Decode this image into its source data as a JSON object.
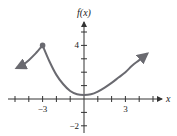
{
  "chart_data": {
    "type": "line",
    "title": "",
    "xlabel": "x",
    "ylabel": "f(x)",
    "xlim": [
      -6,
      5
    ],
    "ylim": [
      -2,
      6
    ],
    "grid": false,
    "legend": null,
    "x_tick_labels": [
      {
        "value": -3,
        "label": "-3"
      },
      {
        "value": 3,
        "label": "3"
      }
    ],
    "y_tick_labels": [
      {
        "value": 4,
        "label": "4"
      },
      {
        "value": -2,
        "label": "-2"
      }
    ],
    "x_ticks": [
      -5,
      -4,
      -3,
      -2,
      -1,
      1,
      2,
      3,
      4,
      5
    ],
    "y_ticks": [
      -2,
      -1,
      1,
      2,
      3,
      4,
      5
    ],
    "series": [
      {
        "name": "left branch",
        "points": [
          [
            -3,
            4
          ],
          [
            -3.5,
            3.4
          ],
          [
            -4,
            2.9
          ],
          [
            -4.5,
            2.5
          ],
          [
            -4.9,
            2.3
          ]
        ],
        "end_arrow": "left"
      },
      {
        "name": "right branch",
        "points": [
          [
            -3,
            4
          ],
          [
            -2.5,
            2.8
          ],
          [
            -2,
            1.8
          ],
          [
            -1.5,
            1.1
          ],
          [
            -1,
            0.6
          ],
          [
            -0.5,
            0.35
          ],
          [
            0,
            0.3
          ],
          [
            0.5,
            0.35
          ],
          [
            1,
            0.55
          ],
          [
            1.5,
            0.85
          ],
          [
            2,
            1.2
          ],
          [
            2.5,
            1.6
          ],
          [
            3,
            2.0
          ],
          [
            3.5,
            2.5
          ],
          [
            4,
            2.9
          ],
          [
            4.6,
            3.4
          ]
        ],
        "end_arrow": "right"
      }
    ],
    "annotations": [
      {
        "type": "closed-dot",
        "x": -3,
        "y": 4
      }
    ],
    "colors": {
      "curve": "#6a6a70",
      "axes": "#333333"
    }
  }
}
